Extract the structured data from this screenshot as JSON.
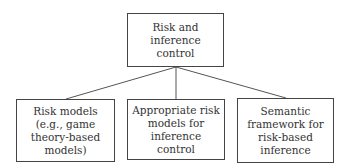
{
  "diagram": {
    "type": "tree",
    "root": {
      "label": "Risk and inference control"
    },
    "children": [
      {
        "label": "Risk models (e.g., game theory-based models)"
      },
      {
        "label": "Appropriate risk models for inference control"
      },
      {
        "label": "Semantic framework for risk-based inference"
      }
    ],
    "colors": {
      "line": "#555555",
      "border": "#444444",
      "text": "#333333",
      "background": "#ffffff"
    }
  }
}
